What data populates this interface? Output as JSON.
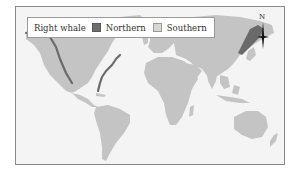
{
  "legend": {
    "title": "Right whale",
    "items": [
      {
        "label": "Northern",
        "color": "#6e6e6e"
      },
      {
        "label": "Southern",
        "color": "#d6d6d6"
      }
    ]
  },
  "compass": {
    "label": "N",
    "icon": "north-arrow-icon"
  },
  "map": {
    "land_color": "#c4c4c4",
    "ocean_color": "#f4f4f4",
    "northern_range_color": "#6a6a6a",
    "regions_highlighted": [
      "North Pacific coast of North America",
      "North Atlantic coast of North America",
      "Sea of Okhotsk / Northwest Pacific"
    ]
  }
}
